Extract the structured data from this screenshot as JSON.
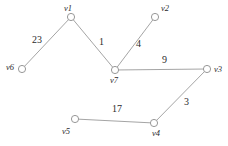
{
  "figure": {
    "type": "undirected-weighted-graph",
    "background_color": "#ffffff",
    "node_fill_color": "#ffffff",
    "node_stroke_color": "#8c8c8c",
    "edge_color": "#9a9a9a",
    "label_color": "#2b2b2b",
    "width": 228,
    "height": 146
  },
  "graph_data": {
    "nodes": [
      {
        "id": "v1",
        "label": "v1",
        "x": 71,
        "y": 17,
        "label_x": 64,
        "label_y": 4,
        "r": 3.6
      },
      {
        "id": "v2",
        "label": "v2",
        "x": 155,
        "y": 17,
        "label_x": 161,
        "label_y": 4,
        "r": 3.6
      },
      {
        "id": "v3",
        "label": "v3",
        "x": 207,
        "y": 69,
        "label_x": 214,
        "label_y": 65,
        "r": 3.6
      },
      {
        "id": "v4",
        "label": "v4",
        "x": 154,
        "y": 123,
        "label_x": 152,
        "label_y": 129,
        "r": 3.6
      },
      {
        "id": "v5",
        "label": "v5",
        "x": 75,
        "y": 119,
        "label_x": 62,
        "label_y": 127,
        "r": 3.6
      },
      {
        "id": "v6",
        "label": "v6",
        "x": 22,
        "y": 69,
        "label_x": 6,
        "label_y": 63,
        "r": 3.6
      },
      {
        "id": "v7",
        "label": "v7",
        "x": 115,
        "y": 70,
        "label_x": 110,
        "label_y": 76,
        "r": 3.6
      }
    ],
    "edges": [
      {
        "source": "v6",
        "target": "v1",
        "weight": 23,
        "label": "23",
        "label_x": 32,
        "label_y": 35
      },
      {
        "source": "v1",
        "target": "v7",
        "weight": 1,
        "label": "1",
        "label_x": 99,
        "label_y": 37
      },
      {
        "source": "v7",
        "target": "v2",
        "weight": 4,
        "label": "4",
        "label_x": 136,
        "label_y": 39
      },
      {
        "source": "v7",
        "target": "v3",
        "weight": 9,
        "label": "9",
        "label_x": 162,
        "label_y": 55
      },
      {
        "source": "v3",
        "target": "v4",
        "weight": 3,
        "label": "3",
        "label_x": 184,
        "label_y": 97
      },
      {
        "source": "v5",
        "target": "v4",
        "weight": 17,
        "label": "17",
        "label_x": 112,
        "label_y": 104
      }
    ]
  }
}
